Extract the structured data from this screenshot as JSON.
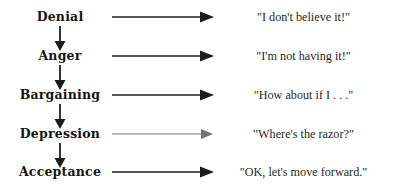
{
  "diagram": {
    "colors": {
      "background": "#ffffff",
      "text": "#1a1a1a",
      "stroke": "#1c1c1c"
    },
    "stages": [
      {
        "label": "Denial",
        "quote": "\"I don't believe it!\"",
        "arrow_icon": "right-arrow-icon",
        "down_arrow_icon": "down-arrow-icon",
        "has_down_arrow": true,
        "faint_arrow": false,
        "y": 4
      },
      {
        "label": "Anger",
        "quote": "\"I'm not having it!\"",
        "arrow_icon": "right-arrow-icon",
        "down_arrow_icon": "down-arrow-icon",
        "has_down_arrow": true,
        "faint_arrow": false,
        "y": 43
      },
      {
        "label": "Bargaining",
        "quote": "\"How about if I . . .\"",
        "arrow_icon": "right-arrow-icon",
        "down_arrow_icon": "down-arrow-icon",
        "has_down_arrow": true,
        "faint_arrow": false,
        "y": 82
      },
      {
        "label": "Depression",
        "quote": "\"Where's the razor?\"",
        "arrow_icon": "right-arrow-icon",
        "down_arrow_icon": "down-arrow-icon",
        "has_down_arrow": true,
        "faint_arrow": true,
        "y": 121
      },
      {
        "label": "Acceptance",
        "quote": "\"OK, let's move forward.\"",
        "arrow_icon": "right-arrow-icon",
        "down_arrow_icon": "down-arrow-icon",
        "has_down_arrow": false,
        "faint_arrow": false,
        "y": 159
      }
    ]
  }
}
